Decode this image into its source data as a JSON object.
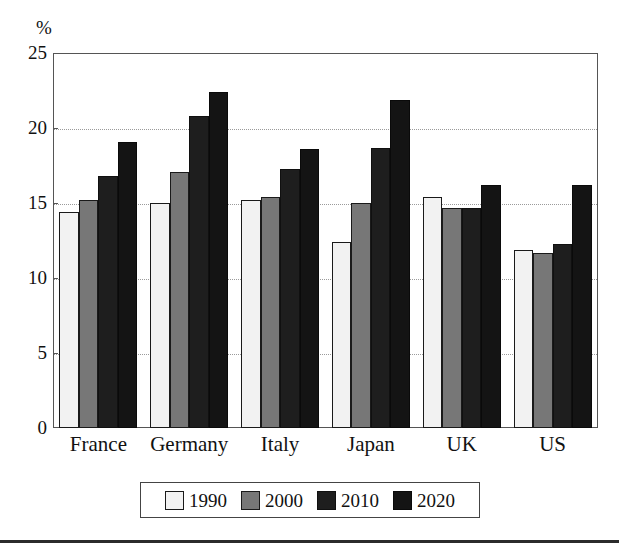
{
  "chart_data": {
    "type": "bar",
    "title": "",
    "subtitle": "",
    "xlabel": "",
    "ylabel": "%",
    "unit_label": "%",
    "ylim": [
      0,
      25
    ],
    "ytick_values": [
      0,
      5,
      10,
      15,
      20,
      25
    ],
    "ytick_labels": [
      "0",
      "5",
      "10",
      "15",
      "20",
      "25"
    ],
    "grid": true,
    "grid_style": "dotted-horizontal",
    "legend_position": "bottom-center",
    "categories": [
      "France",
      "Germany",
      "Italy",
      "Japan",
      "UK",
      "US"
    ],
    "series": [
      {
        "name": "1990",
        "color": "#f2f2f2",
        "values": [
          14.4,
          15.0,
          15.2,
          12.4,
          15.4,
          11.9
        ]
      },
      {
        "name": "2000",
        "color": "#777777",
        "values": [
          15.2,
          17.1,
          15.4,
          15.0,
          14.7,
          11.7
        ]
      },
      {
        "name": "2010",
        "color": "#1e1e1e",
        "values": [
          16.8,
          20.8,
          17.3,
          18.7,
          14.7,
          12.3
        ]
      },
      {
        "name": "2020",
        "color": "#141414",
        "values": [
          19.1,
          22.4,
          18.6,
          21.9,
          16.2,
          16.2
        ]
      }
    ]
  },
  "legend": {
    "items": [
      {
        "label": "1990",
        "swatch_name": "legend-swatch-1990"
      },
      {
        "label": "2000",
        "swatch_name": "legend-swatch-2000"
      },
      {
        "label": "2010",
        "swatch_name": "legend-swatch-2010"
      },
      {
        "label": "2020",
        "swatch_name": "legend-swatch-2020"
      }
    ]
  },
  "colors": {
    "series_1990": "#f2f2f2",
    "series_2000": "#777777",
    "series_2010": "#1e1e1e",
    "series_2020": "#141414",
    "axis": "#555555",
    "grid": "#9a9a9a",
    "text": "#111111",
    "rule": "#2b2b2b"
  }
}
